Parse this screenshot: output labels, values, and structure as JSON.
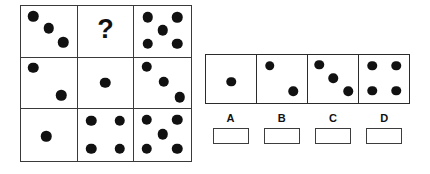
{
  "puzzle": {
    "type": "dot-matrix-analogy",
    "title_visible": false,
    "question_symbol": "?",
    "dot_color": "#111111",
    "border_color": "#3a3a3a",
    "background_color": "#ffffff"
  },
  "matrix": {
    "rows": 3,
    "cols": 3,
    "cells": [
      {
        "id": "cell-r1c1",
        "row": 1,
        "col": 1,
        "kind": "dots",
        "dot_count": 3,
        "pattern": "diagonal-nw-se",
        "dots": [
          {
            "x": 22,
            "y": 20
          },
          {
            "x": 50,
            "y": 44
          },
          {
            "x": 76,
            "y": 72
          }
        ]
      },
      {
        "id": "cell-r1c2",
        "row": 1,
        "col": 2,
        "kind": "question",
        "dot_count": 0,
        "pattern": "unknown",
        "dots": []
      },
      {
        "id": "cell-r1c3",
        "row": 1,
        "col": 3,
        "kind": "dots",
        "dot_count": 5,
        "pattern": "five-quincunx",
        "dots": [
          {
            "x": 24,
            "y": 22
          },
          {
            "x": 76,
            "y": 22
          },
          {
            "x": 50,
            "y": 48
          },
          {
            "x": 24,
            "y": 75
          },
          {
            "x": 76,
            "y": 75
          }
        ]
      },
      {
        "id": "cell-r2c1",
        "row": 2,
        "col": 1,
        "kind": "dots",
        "dot_count": 2,
        "pattern": "diagonal-nw-se",
        "dots": [
          {
            "x": 22,
            "y": 20
          },
          {
            "x": 72,
            "y": 74
          }
        ]
      },
      {
        "id": "cell-r2c2",
        "row": 2,
        "col": 2,
        "kind": "dots",
        "dot_count": 1,
        "pattern": "center",
        "dots": [
          {
            "x": 50,
            "y": 50
          }
        ]
      },
      {
        "id": "cell-r2c3",
        "row": 2,
        "col": 3,
        "kind": "dots",
        "dot_count": 3,
        "pattern": "diagonal-nw-se",
        "dots": [
          {
            "x": 22,
            "y": 18
          },
          {
            "x": 52,
            "y": 48
          },
          {
            "x": 80,
            "y": 78
          }
        ]
      },
      {
        "id": "cell-r3c1",
        "row": 3,
        "col": 1,
        "kind": "dots",
        "dot_count": 1,
        "pattern": "center",
        "dots": [
          {
            "x": 45,
            "y": 52
          }
        ]
      },
      {
        "id": "cell-r3c2",
        "row": 3,
        "col": 2,
        "kind": "dots",
        "dot_count": 4,
        "pattern": "four-corners",
        "dots": [
          {
            "x": 24,
            "y": 22
          },
          {
            "x": 76,
            "y": 22
          },
          {
            "x": 24,
            "y": 76
          },
          {
            "x": 76,
            "y": 76
          }
        ]
      },
      {
        "id": "cell-r3c3",
        "row": 3,
        "col": 3,
        "kind": "dots",
        "dot_count": 5,
        "pattern": "five-quincunx",
        "dots": [
          {
            "x": 22,
            "y": 20
          },
          {
            "x": 76,
            "y": 20
          },
          {
            "x": 50,
            "y": 48
          },
          {
            "x": 22,
            "y": 76
          },
          {
            "x": 76,
            "y": 76
          }
        ]
      }
    ]
  },
  "options": {
    "count": 4,
    "items": [
      {
        "letter": "A",
        "dot_count": 1,
        "pattern": "center",
        "dots": [
          {
            "x": 50,
            "y": 56
          }
        ]
      },
      {
        "letter": "B",
        "dot_count": 2,
        "pattern": "diagonal-nw-se",
        "dots": [
          {
            "x": 25,
            "y": 22
          },
          {
            "x": 72,
            "y": 76
          }
        ]
      },
      {
        "letter": "C",
        "dot_count": 3,
        "pattern": "diagonal-nw-se",
        "dots": [
          {
            "x": 22,
            "y": 20
          },
          {
            "x": 50,
            "y": 48
          },
          {
            "x": 80,
            "y": 76
          }
        ]
      },
      {
        "letter": "D",
        "dot_count": 4,
        "pattern": "four-corners",
        "dots": [
          {
            "x": 26,
            "y": 22
          },
          {
            "x": 74,
            "y": 22
          },
          {
            "x": 26,
            "y": 74
          },
          {
            "x": 74,
            "y": 74
          }
        ]
      }
    ]
  },
  "answer_boxes": {
    "labels": [
      "A",
      "B",
      "C",
      "D"
    ],
    "values": [
      "",
      "",
      "",
      ""
    ]
  }
}
